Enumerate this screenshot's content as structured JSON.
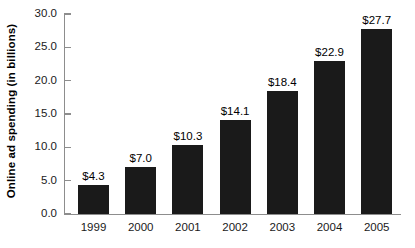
{
  "chart_data": {
    "type": "bar",
    "title": "",
    "xlabel": "",
    "ylabel": "Online ad spending (in billions)",
    "categories": [
      "1999",
      "2000",
      "2001",
      "2002",
      "2003",
      "2004",
      "2005"
    ],
    "values": [
      4.3,
      7.0,
      10.3,
      14.1,
      18.4,
      22.9,
      27.7
    ],
    "data_labels": [
      "$4.3",
      "$7.0",
      "$10.3",
      "$14.1",
      "$18.4",
      "$22.9",
      "$27.7"
    ],
    "ylim": [
      0.0,
      30.0
    ],
    "ytick_values": [
      0.0,
      5.0,
      10.0,
      15.0,
      20.0,
      25.0,
      30.0
    ],
    "ytick_labels": [
      "0.0",
      "5.0",
      "10.0",
      "15.0",
      "20.0",
      "25.0",
      "30.0"
    ],
    "grid": false,
    "legend": null,
    "bar_color": "#1a1a1a",
    "axis_color": "#8d8d8d",
    "background_color": "#ffffff"
  }
}
